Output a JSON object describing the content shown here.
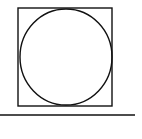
{
  "diagram": {
    "stroke_color": "#111111",
    "background": "#ffffff",
    "square": {
      "x": 18,
      "y": 8,
      "width": 94,
      "height": 98
    },
    "circle": {
      "cx": 66,
      "cy": 57,
      "rx": 46,
      "ry": 48
    },
    "baseline": {
      "x1": 0,
      "y1": 115,
      "x2": 135,
      "y2": 115
    }
  }
}
